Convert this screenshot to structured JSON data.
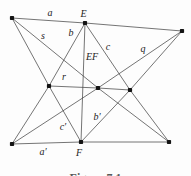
{
  "figure": {
    "width": 191,
    "height": 176,
    "background": "#fdfdfd",
    "line_color": "#474747",
    "line_width": 0.75,
    "dot_color": "#141414",
    "dot_size": 4.2,
    "label_color": "#1c1c1c",
    "label_font_size": 10,
    "caption": "Figure 7.1",
    "points": {
      "top-left": [
        12,
        18
      ],
      "E": [
        85,
        23
      ],
      "top-right": [
        182,
        31
      ],
      "mid-left": [
        49,
        86
      ],
      "mid-center": [
        98,
        88
      ],
      "mid-right": [
        130,
        90
      ],
      "bottom-left": [
        12,
        144
      ],
      "F": [
        81,
        142
      ],
      "bottom-right": [
        169,
        142
      ]
    },
    "lines": [
      {
        "name": "line-a-top",
        "path": [
          "top-left",
          "E",
          "top-right"
        ]
      },
      {
        "name": "line-a-prime-bottom",
        "path": [
          "bottom-left",
          "F",
          "bottom-right"
        ]
      },
      {
        "name": "line-EF",
        "path": [
          "E",
          "F"
        ]
      },
      {
        "name": "line-r",
        "path": [
          "mid-left",
          "mid-center",
          "mid-right"
        ]
      },
      {
        "name": "line-b",
        "path": [
          "E",
          "mid-left",
          "bottom-left"
        ]
      },
      {
        "name": "line-c",
        "path": [
          "E",
          "mid-right",
          "bottom-right"
        ]
      },
      {
        "name": "line-s",
        "path": [
          "top-left",
          "mid-center",
          "bottom-right"
        ]
      },
      {
        "name": "line-q",
        "path": [
          "top-right",
          "mid-center",
          "bottom-left"
        ]
      },
      {
        "name": "line-c-prime",
        "path": [
          "top-left",
          "mid-left",
          "F"
        ]
      },
      {
        "name": "line-b-prime",
        "path": [
          "top-right",
          "mid-right",
          "F"
        ]
      }
    ],
    "labels": [
      {
        "name": "label-a",
        "text": "a",
        "x": 50,
        "y": 12
      },
      {
        "name": "label-E",
        "text": "E",
        "x": 83.5,
        "y": 13
      },
      {
        "name": "label-s",
        "text": "s",
        "x": 43,
        "y": 35
      },
      {
        "name": "label-b",
        "text": "b",
        "x": 71,
        "y": 32
      },
      {
        "name": "label-EF",
        "text": "EF",
        "x": 92,
        "y": 56
      },
      {
        "name": "label-c",
        "text": "c",
        "x": 108,
        "y": 46
      },
      {
        "name": "label-q",
        "text": "q",
        "x": 143,
        "y": 48
      },
      {
        "name": "label-r",
        "text": "r",
        "x": 64,
        "y": 76
      },
      {
        "name": "label-b-prime",
        "text": "b′",
        "x": 97,
        "y": 116
      },
      {
        "name": "label-c-prime",
        "text": "c′",
        "x": 63,
        "y": 126
      },
      {
        "name": "label-a-prime",
        "text": "a′",
        "x": 43,
        "y": 151
      },
      {
        "name": "label-F",
        "text": "F",
        "x": 79,
        "y": 152.5
      }
    ]
  }
}
